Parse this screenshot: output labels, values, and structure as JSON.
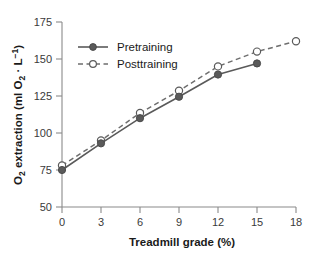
{
  "chart_data": {
    "type": "line",
    "title": "",
    "xlabel": "Treadmill grade (%)",
    "ylabel": "O₂ extraction (ml O₂ · L⁻¹)",
    "xlim": [
      0,
      18
    ],
    "ylim": [
      50,
      175
    ],
    "xticks": [
      0,
      3,
      6,
      9,
      12,
      15,
      18
    ],
    "yticks": [
      50,
      75,
      100,
      125,
      150,
      175
    ],
    "xtick_labels": [
      "0",
      "3",
      "6",
      "9",
      "12",
      "15",
      "18"
    ],
    "ytick_labels": [
      "50",
      "75",
      "100",
      "125",
      "150",
      "175"
    ],
    "grid": false,
    "legend_position": "upper-left",
    "series": [
      {
        "name": "Pretraining",
        "line_style": "solid",
        "marker": "filled-circle",
        "color": "#5a5a5a",
        "x": [
          0,
          3,
          6,
          9,
          12,
          15
        ],
        "values": [
          75,
          93,
          110,
          124.5,
          139.5,
          147
        ]
      },
      {
        "name": "Posttraining",
        "line_style": "dashed",
        "marker": "open-circle",
        "color": "#6e6e6e",
        "x": [
          0,
          3,
          6,
          9,
          12,
          15,
          18
        ],
        "values": [
          78,
          95,
          113.5,
          128.5,
          145,
          155,
          162
        ]
      }
    ]
  },
  "axes": {
    "x_title": "Treadmill grade (%)",
    "y_title_parts": {
      "lead": "O",
      "sub1": "2",
      "mid": " extraction (ml O",
      "sub2": "2",
      "dot": " · L",
      "sup": "−1",
      "close": ")"
    }
  },
  "legend": {
    "items": [
      {
        "label": "Pretraining",
        "style": "solid-filled"
      },
      {
        "label": "Posttraining",
        "style": "dashed-open"
      }
    ]
  },
  "colors": {
    "axis": "#8a8a8a",
    "pretraining": "#5a5a5a",
    "posttraining": "#6e6e6e",
    "text": "#1a1a1a",
    "tick_text": "#3a3a3a",
    "background": "#ffffff"
  },
  "caption": {
    "partial_text": ""
  }
}
